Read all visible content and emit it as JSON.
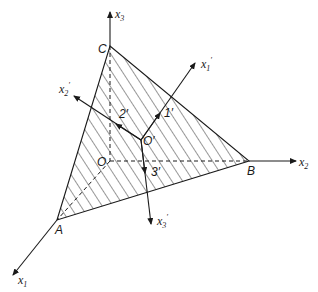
{
  "figure": {
    "type": "3D coordinate diagram",
    "colors": {
      "line": "#1a1a1a",
      "background": "#ffffff"
    },
    "axes": {
      "x1": {
        "label": "x",
        "sub": "1",
        "prime": ""
      },
      "x2": {
        "label": "x",
        "sub": "2",
        "prime": ""
      },
      "x3": {
        "label": "x",
        "sub": "3",
        "prime": ""
      },
      "x1p": {
        "label": "x",
        "sub": "1",
        "prime": "′"
      },
      "x2p": {
        "label": "x",
        "sub": "2",
        "prime": "′"
      },
      "x3p": {
        "label": "x",
        "sub": "3",
        "prime": "′"
      }
    },
    "points": {
      "A": "A",
      "B": "B",
      "C": "C",
      "O": "O",
      "Oprime": "O′"
    },
    "unit_vectors": {
      "one": "1′",
      "two": "2′",
      "three": "3′"
    },
    "shaded_region": "triangle ABC (hatched)"
  }
}
